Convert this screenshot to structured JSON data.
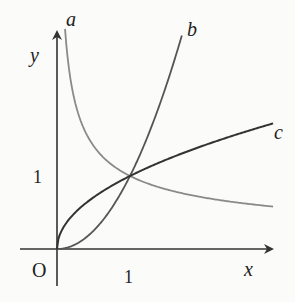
{
  "figure": {
    "type": "function graph",
    "axes": {
      "x_label": "x",
      "y_label": "y",
      "origin_label": "O",
      "x_tick_label": "1",
      "y_tick_label": "1"
    },
    "curves": [
      {
        "name": "a",
        "label": "a",
        "description": "decreasing curve, y = x^(-1/2)-like",
        "exponent": -0.5,
        "color": "#8a8a8a"
      },
      {
        "name": "b",
        "label": "b",
        "description": "steep increasing curve, y = x^2-like",
        "exponent": 2,
        "color": "#555555"
      },
      {
        "name": "c",
        "label": "c",
        "description": "concave increasing curve, y = x^(1/2)-like",
        "exponent": 0.5,
        "color": "#333333"
      }
    ],
    "intersection": {
      "x": 1,
      "y": 1
    }
  },
  "colors": {
    "background": "#fbfbf9",
    "axis": "#333333"
  }
}
